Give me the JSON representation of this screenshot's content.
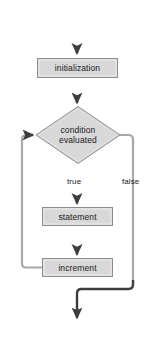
{
  "diagram": {
    "type": "flowchart",
    "background_color": "#ffffff",
    "node_fill_color": "#d8d8d8",
    "node_border_color": "#8c8c8c",
    "arrow_dark_color": "#404040",
    "arrow_gray_color": "#a6a6a6",
    "text_color": "#1a1a1a"
  },
  "nodes": {
    "initialization": {
      "label": "initialization",
      "shape": "rect"
    },
    "condition": {
      "label": "condition\nevaluated",
      "shape": "diamond"
    },
    "statement": {
      "label": "statement",
      "shape": "rect"
    },
    "increment": {
      "label": "increment",
      "shape": "rect"
    }
  },
  "edges": {
    "entry": {
      "label": ""
    },
    "init_to_condition": {
      "label": ""
    },
    "condition_true": {
      "label": "true"
    },
    "condition_false": {
      "label": "false"
    },
    "statement_to_increment": {
      "label": ""
    },
    "increment_loop_back": {
      "label": ""
    },
    "exit": {
      "label": ""
    }
  }
}
